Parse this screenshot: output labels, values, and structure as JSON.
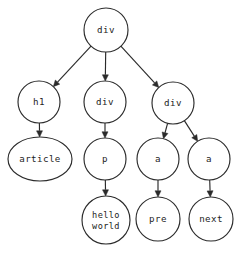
{
  "diagram": {
    "type": "dom-tree",
    "background_color": "#ffffff",
    "stroke_color": "#2b2b2b",
    "text_color": "#1d1d1d",
    "nodes": [
      {
        "id": "root-div",
        "label": "div",
        "shape": "circle",
        "cx": 106,
        "cy": 30,
        "rx": 22,
        "ry": 22
      },
      {
        "id": "h1",
        "label": "h1",
        "shape": "circle",
        "cx": 39,
        "cy": 102,
        "rx": 21,
        "ry": 21
      },
      {
        "id": "mid-div",
        "label": "div",
        "shape": "circle",
        "cx": 105,
        "cy": 102,
        "rx": 21,
        "ry": 21
      },
      {
        "id": "right-div",
        "label": "div",
        "shape": "circle",
        "cx": 173,
        "cy": 103,
        "rx": 21,
        "ry": 21
      },
      {
        "id": "article",
        "label": "article",
        "shape": "ellipse",
        "cx": 40,
        "cy": 159,
        "rx": 32,
        "ry": 22
      },
      {
        "id": "p",
        "label": "p",
        "shape": "circle",
        "cx": 105,
        "cy": 159,
        "rx": 21,
        "ry": 21
      },
      {
        "id": "a-pre",
        "label": "a",
        "shape": "circle",
        "cx": 158,
        "cy": 159,
        "rx": 21,
        "ry": 21
      },
      {
        "id": "a-next",
        "label": "a",
        "shape": "circle",
        "cx": 209,
        "cy": 159,
        "rx": 21,
        "ry": 21
      },
      {
        "id": "hello-world",
        "label_line1": "hello",
        "label_line2": "world",
        "shape": "ellipse",
        "cx": 106,
        "cy": 220,
        "rx": 24,
        "ry": 24
      },
      {
        "id": "pre",
        "label": "pre",
        "shape": "circle",
        "cx": 158,
        "cy": 219,
        "rx": 22,
        "ry": 22
      },
      {
        "id": "next",
        "label": "next",
        "shape": "circle",
        "cx": 211,
        "cy": 219,
        "rx": 22,
        "ry": 22
      }
    ],
    "edges": [
      {
        "id": "e-root-h1",
        "from": "root-div",
        "to": "h1",
        "arrow": true
      },
      {
        "id": "e-root-middiv",
        "from": "root-div",
        "to": "mid-div",
        "arrow": true
      },
      {
        "id": "e-root-rightdiv",
        "from": "root-div",
        "to": "right-div",
        "arrow": true
      },
      {
        "id": "e-h1-article",
        "from": "h1",
        "to": "article",
        "arrow": true
      },
      {
        "id": "e-middiv-p",
        "from": "mid-div",
        "to": "p",
        "arrow": true
      },
      {
        "id": "e-rightdiv-apre",
        "from": "right-div",
        "to": "a-pre",
        "arrow": true
      },
      {
        "id": "e-rightdiv-anext",
        "from": "right-div",
        "to": "a-next",
        "arrow": true
      },
      {
        "id": "e-p-hello",
        "from": "p",
        "to": "hello-world",
        "arrow": true
      },
      {
        "id": "e-apre-pre",
        "from": "a-pre",
        "to": "pre",
        "arrow": true
      },
      {
        "id": "e-anext-next",
        "from": "a-next",
        "to": "next",
        "arrow": true
      }
    ]
  }
}
